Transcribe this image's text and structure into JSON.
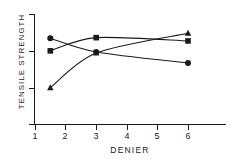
{
  "chart_data": {
    "type": "line",
    "title": "",
    "subtitle": "",
    "xlabel": "DENIER",
    "ylabel": "TENSILE STRENGTH",
    "xlim": [
      0.6,
      6.9
    ],
    "ylim": [
      0.0,
      1.0
    ],
    "xticks": [
      1,
      2,
      3,
      4,
      5,
      6
    ],
    "xticklabels": [
      "1",
      "2",
      "3",
      "4",
      "5",
      "6"
    ],
    "yticks": [
      0.14,
      0.49,
      0.82,
      1.0
    ],
    "yticklabels": [
      "",
      "",
      "",
      ""
    ],
    "grid": false,
    "legend": "none",
    "annotations": [],
    "series": [
      {
        "name": "circle-series",
        "marker": "circle",
        "color": "#1a1a1a",
        "x": [
          1.5,
          3.0,
          6.0
        ],
        "y": [
          0.78,
          0.655,
          0.555
        ]
      },
      {
        "name": "square-series",
        "marker": "square",
        "color": "#1a1a1a",
        "x": [
          1.5,
          3.0,
          6.0
        ],
        "y": [
          0.665,
          0.785,
          0.755
        ]
      },
      {
        "name": "triangle-series",
        "marker": "triangle",
        "color": "#1a1a1a",
        "x": [
          1.5,
          3.0,
          6.0
        ],
        "y": [
          0.33,
          0.645,
          0.825
        ]
      }
    ]
  },
  "axes": {
    "x_title": "DENIER",
    "y_title": "TENSILE STRENGTH",
    "x_tick_labels": [
      "1",
      "2",
      "3",
      "4",
      "5",
      "6"
    ]
  }
}
